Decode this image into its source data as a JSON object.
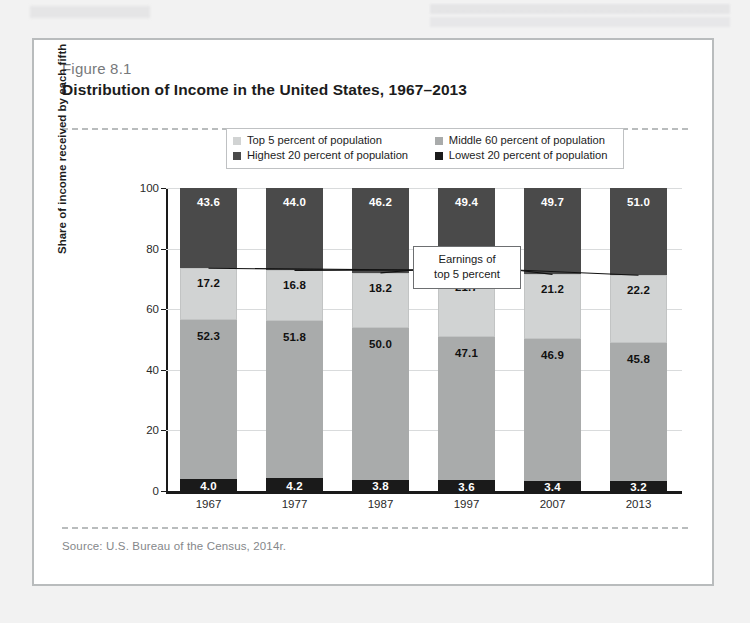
{
  "figure": {
    "number": "Figure 8.1",
    "title": "Distribution of Income in the United States, 1967–2013",
    "source": "Source: U.S. Bureau of the Census, 2014r.",
    "callout": {
      "line1": "Earnings of",
      "line2": "top 5 percent"
    }
  },
  "legend": {
    "items": [
      {
        "label": "Top 5 percent of population",
        "color": "#d1d3d3"
      },
      {
        "label": "Middle 60 percent of population",
        "color": "#a9abab"
      },
      {
        "label": "Highest 20 percent of population",
        "color": "#4a4a4a"
      },
      {
        "label": "Lowest 20 percent of population",
        "color": "#1a1a1a"
      }
    ]
  },
  "colors": {
    "top5": "#d1d3d3",
    "middle60": "#a9abab",
    "highest20": "#4a4a4a",
    "lowest20": "#1a1a1a",
    "grid": "#d9dbdc",
    "axis": "#1a1a1a",
    "card_border": "#b9bcbd"
  },
  "chart_data": {
    "type": "bar",
    "subtype": "stacked",
    "title": "Distribution of Income in the United States, 1967–2013",
    "xlabel": "",
    "ylabel": "Share of income received by each fifth",
    "ylim": [
      0,
      100
    ],
    "yticks": [
      0,
      20,
      40,
      60,
      80,
      100
    ],
    "grid": true,
    "legend_position": "top-center",
    "categories": [
      "1967",
      "1977",
      "1987",
      "1997",
      "2007",
      "2013"
    ],
    "series": [
      {
        "name": "Lowest 20 percent of population",
        "color": "#1a1a1a",
        "values": [
          4.0,
          4.2,
          3.8,
          3.6,
          3.4,
          3.2
        ]
      },
      {
        "name": "Middle 60 percent of population",
        "color": "#a9abab",
        "values": [
          52.3,
          51.8,
          50.0,
          47.1,
          46.9,
          45.8
        ]
      },
      {
        "name": "Highest 20 percent of population",
        "color": "#4a4a4a",
        "values": [
          43.6,
          44.0,
          46.2,
          49.4,
          49.7,
          51.0
        ]
      },
      {
        "name": "Top 5 percent of population",
        "color": "#d1d3d3",
        "values": [
          17.2,
          16.8,
          18.2,
          21.7,
          21.2,
          22.2
        ]
      }
    ]
  }
}
